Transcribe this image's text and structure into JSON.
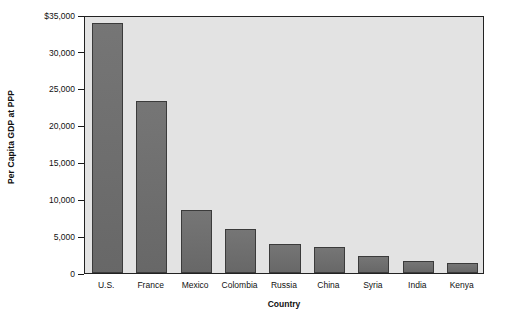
{
  "chart_data": {
    "type": "bar",
    "title": "",
    "xlabel": "Country",
    "ylabel": "Per Capita GDP at PPP",
    "categories": [
      "U.S.",
      "France",
      "Mexico",
      "Colombia",
      "Russia",
      "China",
      "Syria",
      "India",
      "Kenya"
    ],
    "values": [
      33900,
      23300,
      8600,
      6000,
      4000,
      3550,
      2250,
      1600,
      1350
    ],
    "ylim": [
      0,
      35000
    ],
    "yticks": [
      0,
      5000,
      10000,
      15000,
      20000,
      25000,
      30000,
      35000
    ],
    "ytick_labels": [
      "0",
      "5,000",
      "10,000",
      "15,000",
      "20,000",
      "25,000",
      "30,000",
      "$35,000"
    ],
    "grid": false,
    "legend": "none",
    "bar_color": "#6d6d6d",
    "bar_edge_color": "#3b3b3b",
    "panel_color": "#e3e3e3",
    "frame_color": "#222222"
  }
}
